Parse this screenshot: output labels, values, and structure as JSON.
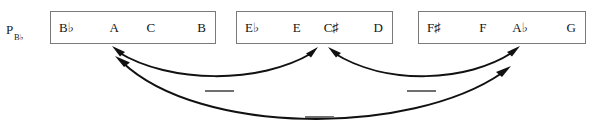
{
  "diagram": {
    "row_label": {
      "base": "P",
      "subscript": "B♭"
    },
    "boxes": [
      {
        "name": "hexachord-box-1",
        "cells": [
          "B♭",
          "A",
          "C",
          "B"
        ]
      },
      {
        "name": "hexachord-box-2",
        "cells": [
          "E♭",
          "E",
          "C♯",
          "D"
        ]
      },
      {
        "name": "hexachord-box-3",
        "cells": [
          "F♯",
          "F",
          "A♭",
          "G"
        ]
      }
    ],
    "arcs": [
      {
        "name": "arc-box1-box2",
        "style": "double-headed"
      },
      {
        "name": "arc-box2-box3",
        "style": "double-headed"
      },
      {
        "name": "arc-box1-box3",
        "style": "double-headed"
      }
    ],
    "dashes": [
      {
        "name": "dash-mark-left"
      },
      {
        "name": "dash-mark-right"
      },
      {
        "name": "dash-mark-center"
      }
    ],
    "colors": {
      "box_border": "#7a7a7a",
      "text": "#141414",
      "arrow": "#111111",
      "dash": "#6f6f6f",
      "background": "#ffffff"
    }
  }
}
